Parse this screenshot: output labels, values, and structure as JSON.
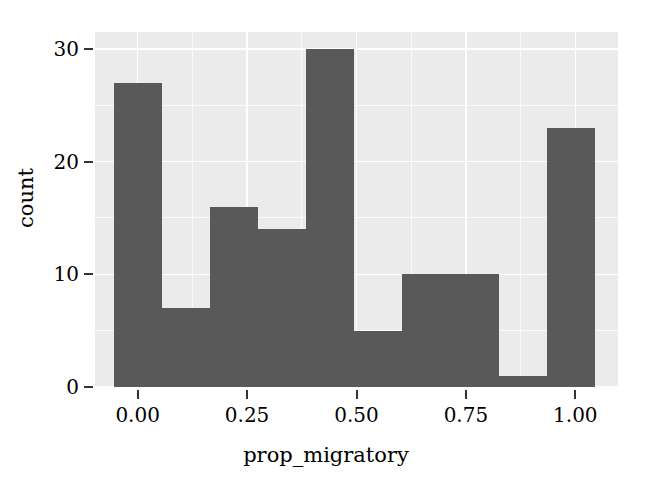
{
  "chart_data": {
    "type": "bar",
    "title": "",
    "subtitle": "",
    "xlabel": "prop_migratory",
    "ylabel": "count",
    "xlim": [
      -0.0975,
      1.0975
    ],
    "ylim": [
      0,
      31.5
    ],
    "xticks": [
      0.0,
      0.25,
      0.5,
      0.75,
      1.0
    ],
    "xtick_labels": [
      "0.00",
      "0.25",
      "0.50",
      "0.75",
      "1.00"
    ],
    "yticks": [
      0,
      10,
      20,
      30
    ],
    "ytick_labels": [
      "0",
      "10",
      "20",
      "30"
    ],
    "y_minor_ticks": [
      5,
      15,
      25
    ],
    "x_minor_ticks": [
      0.125,
      0.375,
      0.625,
      0.875
    ],
    "grid": true,
    "legend": false,
    "panel_background": "#ebebeb",
    "grid_color": "#ffffff",
    "bar_color": "#595959",
    "bin_width": 0.11,
    "bin_edges": [
      -0.055,
      0.055,
      0.165,
      0.275,
      0.385,
      0.495,
      0.605,
      0.715,
      0.825,
      0.935,
      1.045
    ],
    "bin_centers": [
      0.0,
      0.11,
      0.22,
      0.33,
      0.44,
      0.55,
      0.66,
      0.77,
      0.88,
      0.99
    ],
    "categories": [
      "-0.055–0.055",
      "0.055–0.165",
      "0.165–0.275",
      "0.275–0.385",
      "0.385–0.495",
      "0.495–0.605",
      "0.605–0.715",
      "0.715–0.825",
      "0.825–0.935",
      "0.935–1.045"
    ],
    "values": [
      27,
      7,
      16,
      14,
      30,
      5,
      10,
      10,
      1,
      23
    ],
    "bars": [
      {
        "label": "bin-1",
        "x0": -0.055,
        "x1": 0.055,
        "value": 27
      },
      {
        "label": "bin-2",
        "x0": 0.055,
        "x1": 0.165,
        "value": 7
      },
      {
        "label": "bin-3",
        "x0": 0.165,
        "x1": 0.275,
        "value": 16
      },
      {
        "label": "bin-4",
        "x0": 0.275,
        "x1": 0.385,
        "value": 14
      },
      {
        "label": "bin-5",
        "x0": 0.385,
        "x1": 0.495,
        "value": 30
      },
      {
        "label": "bin-6",
        "x0": 0.495,
        "x1": 0.605,
        "value": 5
      },
      {
        "label": "bin-7",
        "x0": 0.605,
        "x1": 0.715,
        "value": 10
      },
      {
        "label": "bin-8",
        "x0": 0.715,
        "x1": 0.825,
        "value": 10
      },
      {
        "label": "bin-9",
        "x0": 0.825,
        "x1": 0.935,
        "value": 1
      },
      {
        "label": "bin-10",
        "x0": 0.935,
        "x1": 1.045,
        "value": 23
      }
    ]
  }
}
